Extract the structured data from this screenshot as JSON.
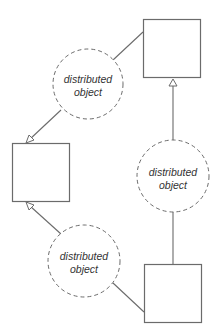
{
  "diagram": {
    "type": "object-relationship",
    "colors": {
      "stroke": "#6b6b6b",
      "text": "#333333",
      "background": "#ffffff"
    },
    "nodes": [
      {
        "id": "box-top-right",
        "shape": "square",
        "label": ""
      },
      {
        "id": "box-left",
        "shape": "square",
        "label": ""
      },
      {
        "id": "box-bottom-right",
        "shape": "square",
        "label": ""
      },
      {
        "id": "circle-top",
        "shape": "dashed-circle",
        "line1": "distributed",
        "line2": "object"
      },
      {
        "id": "circle-right",
        "shape": "dashed-circle",
        "line1": "distributed",
        "line2": "object"
      },
      {
        "id": "circle-bottom",
        "shape": "dashed-circle",
        "line1": "distributed",
        "line2": "object"
      }
    ],
    "edges": [
      {
        "from": "box-top-right",
        "to": "circle-top",
        "arrow": "none"
      },
      {
        "from": "circle-top",
        "to": "box-left",
        "arrow": "hollow-triangle"
      },
      {
        "from": "box-bottom-right",
        "to": "circle-right",
        "arrow": "none"
      },
      {
        "from": "circle-right",
        "to": "box-top-right",
        "arrow": "hollow-triangle"
      },
      {
        "from": "box-bottom-right",
        "to": "circle-bottom",
        "arrow": "none"
      },
      {
        "from": "circle-bottom",
        "to": "box-left",
        "arrow": "hollow-triangle"
      }
    ]
  }
}
